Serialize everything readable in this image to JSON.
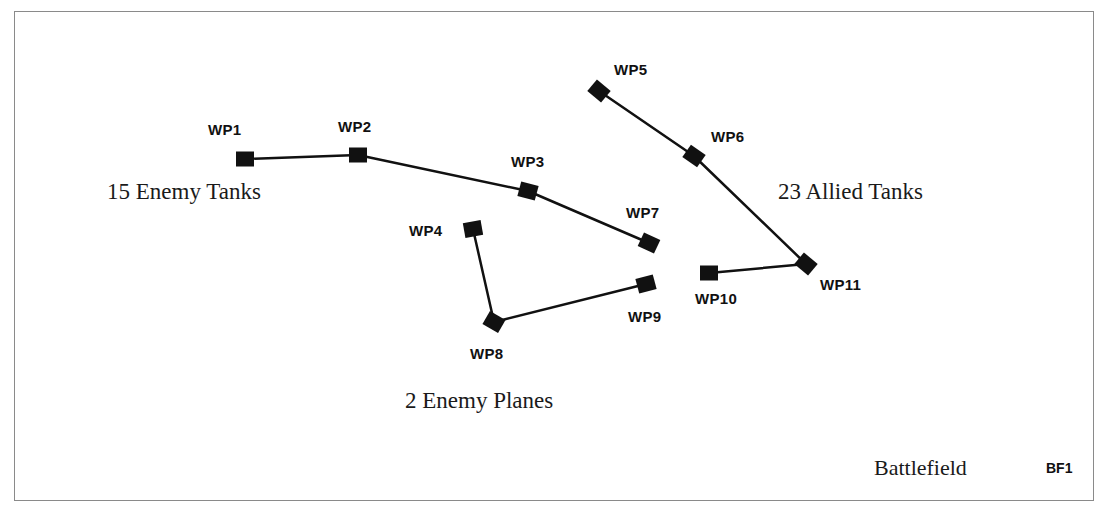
{
  "diagram": {
    "title": "Battlefield",
    "id": "BF1",
    "colors": {
      "marker": "#111111",
      "path": "#111111",
      "frame": "#8a8a8a",
      "background": "#ffffff"
    },
    "waypoints": [
      {
        "id": "WP1",
        "label": "WP1",
        "x": 245,
        "y": 159,
        "rotation": 0
      },
      {
        "id": "WP2",
        "label": "WP2",
        "x": 358,
        "y": 155,
        "rotation": 0
      },
      {
        "id": "WP3",
        "label": "WP3",
        "x": 528,
        "y": 191,
        "rotation": 15
      },
      {
        "id": "WP4",
        "label": "WP4",
        "x": 473,
        "y": 229,
        "rotation": -10
      },
      {
        "id": "WP5",
        "label": "WP5",
        "x": 599,
        "y": 91,
        "rotation": 40
      },
      {
        "id": "WP6",
        "label": "WP6",
        "x": 694,
        "y": 156,
        "rotation": 35
      },
      {
        "id": "WP7",
        "label": "WP7",
        "x": 649,
        "y": 243,
        "rotation": 25
      },
      {
        "id": "WP8",
        "label": "WP8",
        "x": 494,
        "y": 322,
        "rotation": 30
      },
      {
        "id": "WP9",
        "label": "WP9",
        "x": 646,
        "y": 284,
        "rotation": -15
      },
      {
        "id": "WP10",
        "label": "WP10",
        "x": 709,
        "y": 273,
        "rotation": 0
      },
      {
        "id": "WP11",
        "label": "WP11",
        "x": 806,
        "y": 264,
        "rotation": 40
      }
    ],
    "routes": [
      {
        "name": "enemy-tanks-route",
        "points": [
          "WP1",
          "WP2",
          "WP3",
          "WP7"
        ]
      },
      {
        "name": "enemy-planes-route",
        "points": [
          "WP4",
          "WP8",
          "WP9"
        ]
      },
      {
        "name": "allied-tanks-route",
        "points": [
          "WP5",
          "WP6",
          "WP11",
          "WP10"
        ]
      }
    ],
    "groups": [
      {
        "name": "enemy-tanks",
        "label": "15 Enemy Tanks"
      },
      {
        "name": "allied-tanks",
        "label": "23 Allied Tanks"
      },
      {
        "name": "enemy-planes",
        "label": "2 Enemy Planes"
      }
    ]
  }
}
